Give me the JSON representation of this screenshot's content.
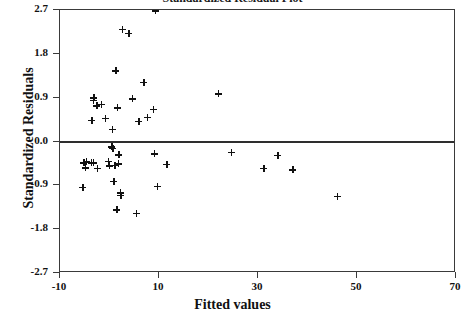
{
  "chart_data": {
    "type": "scatter",
    "title": "Standardized Residual Plot",
    "xlabel": "Fitted values",
    "ylabel": "Standardized Residuals",
    "xlim": [
      -10,
      70
    ],
    "ylim": [
      -2.7,
      2.7
    ],
    "xticks": [
      -10,
      10,
      30,
      50,
      70
    ],
    "xtick_labels": [
      "-10",
      "10",
      "30",
      "50",
      "70"
    ],
    "yticks": [
      2.7,
      1.8,
      0.9,
      0.0,
      -0.9,
      -1.8,
      -2.7
    ],
    "ytick_labels": [
      "2.7",
      "1.8",
      "0.9",
      "0.0",
      "-0.9",
      "-1.8",
      "-2.7"
    ],
    "grid": false,
    "legend": false,
    "marker": "plus",
    "marker_color": "#111111",
    "reference_line": {
      "y": 0.0,
      "color": "#2e2e2e",
      "width": 2
    },
    "points": [
      {
        "x": 9.2,
        "y": 2.68
      },
      {
        "x": 2.6,
        "y": 2.3
      },
      {
        "x": 3.9,
        "y": 2.22
      },
      {
        "x": 1.3,
        "y": 1.45
      },
      {
        "x": 6.9,
        "y": 1.21
      },
      {
        "x": 22.0,
        "y": 0.98
      },
      {
        "x": -3.2,
        "y": 0.9
      },
      {
        "x": -3.3,
        "y": 0.84
      },
      {
        "x": 4.6,
        "y": 0.88
      },
      {
        "x": -1.7,
        "y": 0.76
      },
      {
        "x": -2.6,
        "y": 0.73
      },
      {
        "x": 8.9,
        "y": 0.66
      },
      {
        "x": 1.6,
        "y": 0.69
      },
      {
        "x": -3.6,
        "y": 0.44
      },
      {
        "x": -0.8,
        "y": 0.47
      },
      {
        "x": 7.6,
        "y": 0.5
      },
      {
        "x": 5.9,
        "y": 0.42
      },
      {
        "x": 0.6,
        "y": 0.25
      },
      {
        "x": 0.5,
        "y": -0.11
      },
      {
        "x": 0.7,
        "y": -0.14
      },
      {
        "x": 1.9,
        "y": -0.27
      },
      {
        "x": 9.0,
        "y": -0.25
      },
      {
        "x": 24.6,
        "y": -0.22
      },
      {
        "x": 34.0,
        "y": -0.28
      },
      {
        "x": -5.2,
        "y": -0.44
      },
      {
        "x": -4.7,
        "y": -0.42
      },
      {
        "x": -3.7,
        "y": -0.44
      },
      {
        "x": -3.3,
        "y": -0.44
      },
      {
        "x": -0.2,
        "y": -0.41
      },
      {
        "x": 1.8,
        "y": -0.46
      },
      {
        "x": -0.1,
        "y": -0.5
      },
      {
        "x": 1.1,
        "y": -0.49
      },
      {
        "x": 11.6,
        "y": -0.47
      },
      {
        "x": -4.9,
        "y": -0.54
      },
      {
        "x": -2.5,
        "y": -0.55
      },
      {
        "x": 37.0,
        "y": -0.58
      },
      {
        "x": 31.2,
        "y": -0.55
      },
      {
        "x": 0.9,
        "y": -0.82
      },
      {
        "x": 9.6,
        "y": -0.92
      },
      {
        "x": -5.4,
        "y": -0.94
      },
      {
        "x": 2.2,
        "y": -1.05
      },
      {
        "x": 2.3,
        "y": -1.11
      },
      {
        "x": 46.0,
        "y": -1.12
      },
      {
        "x": 1.5,
        "y": -1.4
      },
      {
        "x": 5.4,
        "y": -1.48
      }
    ]
  }
}
